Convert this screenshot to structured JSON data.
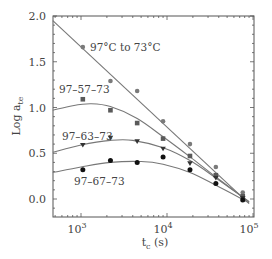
{
  "chart_data": {
    "type": "scatter",
    "title": "",
    "xlabel": "t_c (s)",
    "ylabel": "Log a_te",
    "xscale": "log",
    "xlim": [
      470,
      100000
    ],
    "ylim": [
      -0.2,
      2.0
    ],
    "grid": false,
    "legend": "inline labels",
    "x_ticks": [
      {
        "value": 1000,
        "label": "10",
        "exp": "3"
      },
      {
        "value": 10000,
        "label": "10",
        "exp": "4"
      },
      {
        "value": 100000,
        "label": "10",
        "exp": "5"
      }
    ],
    "y_ticks": [
      "0.0",
      "0.5",
      "1.0",
      "1.5",
      "2.0"
    ],
    "y_tick_values": [
      0.0,
      0.5,
      1.0,
      1.5,
      2.0
    ],
    "series": [
      {
        "name": "97°C to 73°C",
        "marker": "circle-gray",
        "x": [
          1050,
          2200,
          4500,
          9000,
          18500,
          37000,
          76000
        ],
        "values": [
          1.66,
          1.29,
          1.18,
          0.85,
          0.6,
          0.35,
          0.07
        ],
        "fit": "linear",
        "fit_points": [
          [
            470,
            1.95
          ],
          [
            90000,
            -0.05
          ]
        ]
      },
      {
        "name": "97–57–73",
        "marker": "square",
        "x": [
          1050,
          2200,
          4500,
          9000,
          18500,
          37000,
          76000
        ],
        "values": [
          1.09,
          0.97,
          0.83,
          0.66,
          0.47,
          0.26,
          0.03
        ],
        "fit": "curve",
        "fit_points": [
          [
            470,
            0.97
          ],
          [
            800,
            1.02
          ],
          [
            1300,
            1.04
          ],
          [
            2200,
            1.01
          ],
          [
            4500,
            0.88
          ],
          [
            9000,
            0.68
          ],
          [
            18500,
            0.46
          ],
          [
            37000,
            0.24
          ],
          [
            90000,
            -0.03
          ]
        ]
      },
      {
        "name": "97–63–73",
        "marker": "triangle-down",
        "x": [
          1050,
          2200,
          4500,
          9000,
          18500,
          37000,
          76000
        ],
        "values": [
          0.59,
          0.67,
          0.63,
          0.55,
          0.39,
          0.23,
          0.01
        ],
        "fit": "curve",
        "fit_points": [
          [
            470,
            0.51
          ],
          [
            1000,
            0.59
          ],
          [
            2200,
            0.64
          ],
          [
            4000,
            0.64
          ],
          [
            9000,
            0.56
          ],
          [
            18500,
            0.42
          ],
          [
            37000,
            0.23
          ],
          [
            90000,
            -0.03
          ]
        ]
      },
      {
        "name": "97–67–73",
        "marker": "circle-black",
        "x": [
          1050,
          2200,
          4500,
          9000,
          18500,
          37000,
          76000
        ],
        "values": [
          0.32,
          0.42,
          0.4,
          0.46,
          0.32,
          0.17,
          -0.01
        ],
        "fit": "curve",
        "fit_points": [
          [
            470,
            0.29
          ],
          [
            1000,
            0.35
          ],
          [
            2200,
            0.4
          ],
          [
            5000,
            0.41
          ],
          [
            9000,
            0.38
          ],
          [
            18500,
            0.29
          ],
          [
            37000,
            0.15
          ],
          [
            90000,
            -0.04
          ]
        ]
      }
    ]
  },
  "labels": {
    "series_0": "97°C to 73°C",
    "series_1": "97–57–73",
    "series_2": "97–63–73",
    "series_3": "97–67–73",
    "ylabel_main": "Log a",
    "ylabel_sub": "te",
    "xlabel_main": "t",
    "xlabel_sub": "c",
    "xlabel_unit": " (s)"
  }
}
